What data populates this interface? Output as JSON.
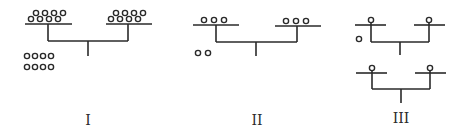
{
  "diagram": {
    "stroke_color": "#2a2a2a",
    "background": "#ffffff",
    "figures": [
      {
        "id": "I",
        "label": "I",
        "description": "Two branches each carrying 8 staggered circles on a bar, joined by a connector with a central stem; 8 separate circles in a 2x4 grid below-left",
        "branch_circle_counts": [
          8,
          8
        ],
        "loose_circle_count": 8
      },
      {
        "id": "II",
        "label": "II",
        "description": "Two branches each carrying 3 circles on a bar, joined by a connector with a central stem; 2 separate circles below-left",
        "branch_circle_counts": [
          3,
          3
        ],
        "loose_circle_count": 2
      },
      {
        "id": "III",
        "label": "III",
        "description": "Two stacked tree structures, each with two branches carrying 1 circle; 1 separate circle beside the upper tree",
        "branch_circle_counts": [
          1,
          1,
          1,
          1
        ],
        "loose_circle_count": 1
      }
    ]
  }
}
